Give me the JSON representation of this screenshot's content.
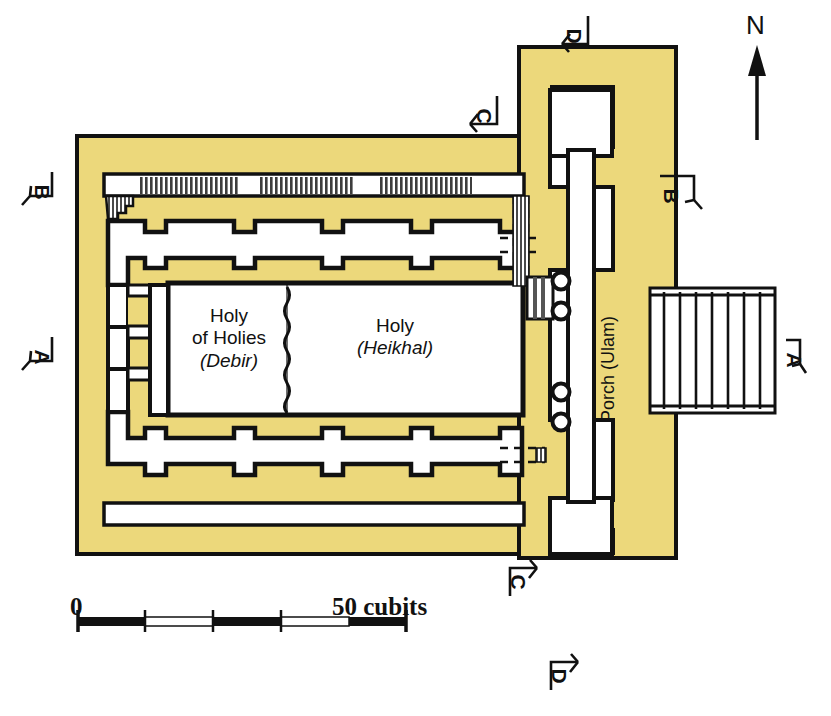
{
  "diagram": {
    "title_present": false,
    "colors": {
      "wall_fill": "#ecd87b",
      "room_fill": "#ffffff",
      "outline": "#111111",
      "background": "#ffffff",
      "hatch": "#3a3a3a"
    }
  },
  "rooms": [
    {
      "id": "holy-of-holies",
      "line1": "Holy",
      "line2": "of Holies",
      "line3": "(Debir)"
    },
    {
      "id": "holy-place",
      "line1": "Holy",
      "line2": "(Heikhal)"
    }
  ],
  "porch": {
    "label": "Porch (Ulam)"
  },
  "compass": {
    "label": "N"
  },
  "scale": {
    "start_label": "0",
    "end_label": "50 cubits",
    "units": "cubits",
    "min": 0,
    "max": 50,
    "segments": 4,
    "tick_values": [
      0,
      12.5,
      25,
      37.5,
      50
    ]
  },
  "section_markers": [
    {
      "id": "marker-a-left",
      "letter": "A"
    },
    {
      "id": "marker-a-right",
      "letter": "A"
    },
    {
      "id": "marker-b-left",
      "letter": "B"
    },
    {
      "id": "marker-b-right",
      "letter": "B"
    },
    {
      "id": "marker-c-top",
      "letter": "C"
    },
    {
      "id": "marker-c-bottom",
      "letter": "C"
    },
    {
      "id": "marker-d-top",
      "letter": "D"
    },
    {
      "id": "marker-d-bottom",
      "letter": "D"
    }
  ],
  "features": {
    "pillars_count": 4,
    "pillar_label": "free-standing pillars",
    "stairway_label": "stairway",
    "side_chambers_label": "side chambers",
    "doorway_label": "doorway"
  }
}
